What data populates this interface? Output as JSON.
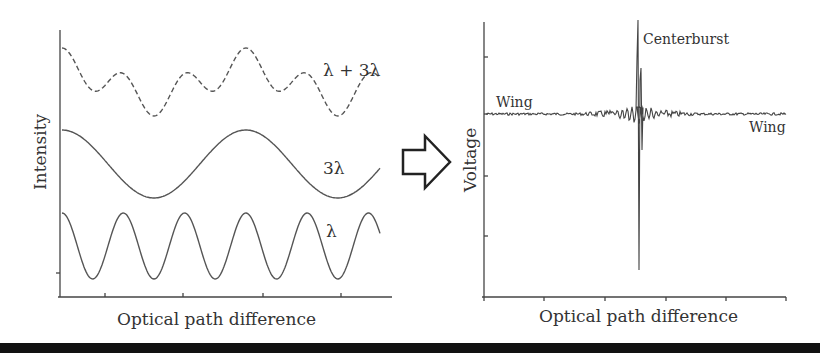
{
  "left_panel": {
    "ylabel": "Intensity",
    "xlabel": "Optical path difference",
    "curves": [
      {
        "name": "combined",
        "label": "λ + 3λ",
        "style": "dashed"
      },
      {
        "name": "long-wave",
        "label": "3λ",
        "style": "solid"
      },
      {
        "name": "short-wave",
        "label": "λ",
        "style": "solid"
      }
    ]
  },
  "arrow": {
    "direction": "right"
  },
  "right_panel": {
    "ylabel": "Voltage",
    "xlabel": "Optical path difference",
    "annotations": {
      "centerburst": "Centerburst",
      "wing_left": "Wing",
      "wing_right": "Wing"
    }
  },
  "chart_data": [
    {
      "type": "line",
      "title": "",
      "xlabel": "Optical path difference",
      "ylabel": "Intensity",
      "series": [
        {
          "name": "λ + 3λ",
          "description": "sum of two cosines, dashed"
        },
        {
          "name": "3λ",
          "description": "cosine, ~1.75 periods across axis"
        },
        {
          "name": "λ",
          "description": "cosine, ~5.25 periods across axis"
        }
      ],
      "grid": false,
      "legend": "inline labels at right"
    },
    {
      "type": "line",
      "title": "",
      "xlabel": "Optical path difference",
      "ylabel": "Voltage",
      "series": [
        {
          "name": "interferogram",
          "description": "flat noisy wings with sharp centerburst near 50% of x-range"
        }
      ],
      "annotations": [
        "Centerburst",
        "Wing",
        "Wing"
      ],
      "grid": false
    }
  ]
}
